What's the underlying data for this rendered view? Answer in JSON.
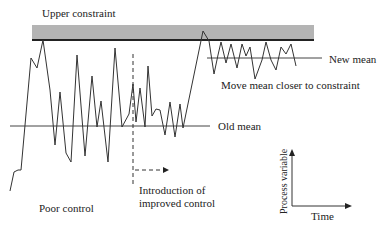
{
  "labels": {
    "upper_constraint": "Upper constraint",
    "new_mean": "New mean",
    "move_mean": "Move mean closer to constraint",
    "old_mean": "Old mean",
    "introduction_line1": "Introduction of",
    "introduction_line2": "improved control",
    "poor_control": "Poor control",
    "axis_y": "Process variable",
    "axis_x": "Time"
  },
  "colors": {
    "constraint_band": "#b4b4b4",
    "constraint_edge": "#222222",
    "signal": "#333333",
    "mean_line": "#444444"
  },
  "geometry": {
    "constraint_band": {
      "x": 32,
      "y": 25,
      "w": 282,
      "h": 15
    },
    "old_mean": {
      "x1": 10,
      "x2": 210,
      "y": 126
    },
    "new_mean": {
      "x1": 207,
      "x2": 322,
      "y": 58
    },
    "intro_dashed_vertical": {
      "x": 133,
      "y1": 54,
      "y2": 186
    },
    "intro_arrow": {
      "x1": 135,
      "x2": 168,
      "y": 170
    }
  },
  "signal_points": "10,191 14,172 18,170 21,170 31,58 37,68 43,40 50,90 55,145 60,92 66,153 71,162 77,55 85,156 92,76 97,127 101,101 108,162 115,48 122,127 129,114 133,84 136,122 140,88 145,127 148,66 152,116 156,109 160,110 165,135 170,102 175,137 180,104 183,128 203,31 209,41 214,74 218,55 221,42 226,63 231,44 237,68 242,44 246,56 250,47 255,79 262,60 266,42 271,60 276,70 281,47 286,54 291,44 296,66"
}
